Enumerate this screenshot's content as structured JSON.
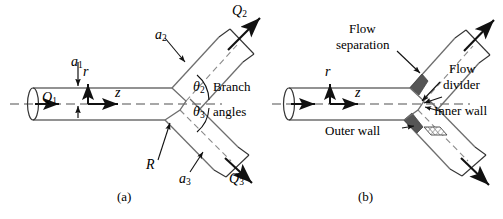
{
  "figure": {
    "type": "engineering-diagram",
    "colors": {
      "line": "#1a1a1a",
      "pipe_edge": "#6e6e6e",
      "centerline": "#808080",
      "separation_fill": "#555555",
      "background": "#ffffff"
    }
  },
  "panel_a": {
    "caption": "(a)",
    "labels": {
      "q1": "Q",
      "q1_sub": "1",
      "q2": "Q",
      "q2_sub": "2",
      "q3": "Q",
      "q3_sub": "3",
      "a1": "a",
      "a1_sub": "1",
      "a2": "a",
      "a2_sub": "2",
      "a3": "a",
      "a3_sub": "3",
      "radius": "R",
      "axis_r": "r",
      "axis_z": "z",
      "theta2": "θ",
      "theta2_sub": "2",
      "theta3": "θ",
      "theta3_sub": "3",
      "branch_word": "Branch",
      "angles_word": "angles"
    }
  },
  "panel_b": {
    "caption": "(b)",
    "labels": {
      "axis_r": "r",
      "axis_z": "z",
      "flow_separation_line1": "Flow",
      "flow_separation_line2": "separation",
      "flow_divider_line1": "Flow",
      "flow_divider_line2": "divider",
      "inner_wall": "Inner wall",
      "outer_wall": "Outer wall"
    }
  }
}
